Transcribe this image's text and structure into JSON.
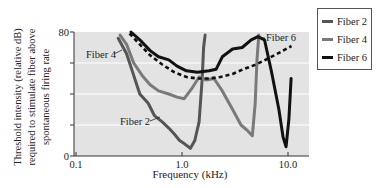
{
  "chart_data": {
    "type": "line",
    "title": "",
    "xlabel": "Frequency (kHz)",
    "ylabel_lines": [
      "Threshold intensity (relative dB)",
      "required to stimulate fiber above",
      "spontaneous firing rate"
    ],
    "xscale": "log",
    "xlim": [
      0.1,
      13
    ],
    "ylim": [
      0,
      80
    ],
    "xticks": [
      {
        "value": 0.1,
        "label": "0.1"
      },
      {
        "value": 1.0,
        "label": "1.0"
      },
      {
        "value": 10.0,
        "label": "10.0"
      }
    ],
    "yticks": [
      {
        "value": 0,
        "label": "0"
      },
      {
        "value": 20,
        "label": ""
      },
      {
        "value": 40,
        "label": ""
      },
      {
        "value": 60,
        "label": ""
      },
      {
        "value": 80,
        "label": "80"
      }
    ],
    "grid": true,
    "legend_position": "right",
    "series": [
      {
        "name": "Fiber 2",
        "color": "#555555",
        "x": [
          0.25,
          0.3,
          0.35,
          0.4,
          0.48,
          0.55,
          0.65,
          0.75,
          0.85,
          0.95,
          1.05,
          1.2,
          1.32,
          1.45,
          1.55,
          1.6,
          1.65
        ],
        "y": [
          76,
          66,
          52,
          40,
          34,
          26,
          22,
          18,
          14,
          10,
          8,
          5,
          10,
          22,
          50,
          70,
          78
        ]
      },
      {
        "name": "Fiber 4",
        "color": "#7a7a7a",
        "x": [
          0.26,
          0.3,
          0.35,
          0.42,
          0.5,
          0.6,
          0.75,
          0.9,
          1.05,
          1.25,
          1.45,
          1.7,
          2.0,
          2.4,
          3.0,
          3.6,
          4.2,
          4.6,
          4.9,
          5.1,
          5.3
        ],
        "y": [
          78,
          72,
          60,
          52,
          46,
          42,
          40,
          38,
          37,
          44,
          51,
          49,
          50,
          42,
          30,
          20,
          16,
          13,
          34,
          62,
          78
        ]
      },
      {
        "name": "Fiber 6",
        "color": "#111111",
        "x": [
          0.33,
          0.4,
          0.5,
          0.6,
          0.75,
          0.9,
          1.1,
          1.4,
          1.8,
          2.1,
          2.4,
          3.0,
          3.7,
          4.5,
          5.2,
          6.0,
          7.0,
          8.2,
          9.0,
          9.6,
          10.2,
          10.7
        ],
        "y": [
          80,
          75,
          68,
          64,
          62,
          58,
          55,
          54,
          55,
          56,
          64,
          69,
          70,
          75,
          77,
          75,
          54,
          30,
          12,
          6,
          24,
          50
        ]
      }
    ],
    "reference_curve": {
      "name": "Envelope (dashed)",
      "color": "#111111",
      "style": "dashed",
      "x": [
        0.32,
        0.4,
        0.5,
        0.65,
        0.85,
        1.1,
        1.4,
        1.8,
        2.3,
        3.0,
        3.8,
        5.0,
        6.5,
        8.5,
        10.8
      ],
      "y": [
        79,
        72,
        65,
        59,
        54,
        51,
        50,
        50,
        51,
        53,
        56,
        59,
        63,
        67,
        71
      ]
    },
    "annotations": [
      {
        "text": "Fiber 4",
        "x": 0.27,
        "y": 64,
        "points_to": "Fiber 4"
      },
      {
        "text": "Fiber 2",
        "x": 0.55,
        "y": 20,
        "points_to": "Fiber 2"
      },
      {
        "text": "Fiber 6",
        "x": 7.5,
        "y": 76,
        "points_to": "Fiber 6"
      }
    ]
  },
  "legend": {
    "items": [
      {
        "label": "Fiber 2",
        "color": "#555555"
      },
      {
        "label": "Fiber 4",
        "color": "#7a7a7a"
      },
      {
        "label": "Fiber 6",
        "color": "#111111"
      }
    ]
  }
}
